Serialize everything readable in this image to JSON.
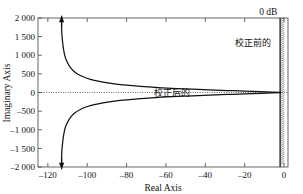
{
  "chart_data": {
    "type": "line",
    "title": "",
    "xlabel": "Real Axis",
    "ylabel": "Imaginary Axis",
    "xlim": [
      -125,
      2
    ],
    "ylim": [
      -2000,
      2000
    ],
    "grid": false,
    "xticks": [
      -120,
      -100,
      -80,
      -60,
      -40,
      -20,
      0
    ],
    "xticklabels": [
      "-120",
      "-100",
      "-80",
      "-60",
      "-40",
      "-20",
      "0"
    ],
    "yticks": [
      -2000,
      -1500,
      -1000,
      -500,
      0,
      500,
      1000,
      1500,
      2000
    ],
    "yticklabels": [
      "-2 000",
      "-1 500",
      "-1 000",
      "-500",
      "0",
      "500",
      "1 000",
      "1 500",
      "2 000"
    ],
    "series": [
      {
        "name": "corrected-locus-upper",
        "asymptote_x": -113,
        "points": [
          [
            -113,
            2000
          ],
          [
            -113,
            1700
          ],
          [
            -112.6,
            1400
          ],
          [
            -112.0,
            1150
          ],
          [
            -111.2,
            950
          ],
          [
            -110.0,
            800
          ],
          [
            -108.4,
            660
          ],
          [
            -106.2,
            545
          ],
          [
            -103.5,
            455
          ],
          [
            -100.2,
            383
          ],
          [
            -96.4,
            325
          ],
          [
            -92.0,
            278
          ],
          [
            -87.0,
            238
          ],
          [
            -81.5,
            204
          ],
          [
            -75.5,
            175
          ],
          [
            -69.0,
            150
          ],
          [
            -62.0,
            127
          ],
          [
            -54.5,
            107
          ],
          [
            -46.5,
            88
          ],
          [
            -38.0,
            70
          ],
          [
            -29.0,
            53
          ],
          [
            -20.0,
            37
          ],
          [
            -12.0,
            22
          ],
          [
            -6.0,
            11
          ],
          [
            -2.5,
            4
          ],
          [
            -1.5,
            0
          ]
        ]
      },
      {
        "name": "corrected-locus-lower",
        "asymptote_x": -113,
        "points": [
          [
            -113,
            -2000
          ],
          [
            -113,
            -1700
          ],
          [
            -112.6,
            -1400
          ],
          [
            -112.0,
            -1150
          ],
          [
            -111.2,
            -950
          ],
          [
            -110.0,
            -800
          ],
          [
            -108.4,
            -660
          ],
          [
            -106.2,
            -545
          ],
          [
            -103.5,
            -455
          ],
          [
            -100.2,
            -383
          ],
          [
            -96.4,
            -325
          ],
          [
            -92.0,
            -278
          ],
          [
            -87.0,
            -238
          ],
          [
            -81.5,
            -204
          ],
          [
            -75.5,
            -175
          ],
          [
            -69.0,
            -150
          ],
          [
            -62.0,
            -127
          ],
          [
            -54.5,
            -107
          ],
          [
            -46.5,
            -88
          ],
          [
            -38.0,
            -70
          ],
          [
            -29.0,
            -53
          ],
          [
            -20.0,
            -37
          ],
          [
            -12.0,
            -22
          ],
          [
            -6.0,
            -11
          ],
          [
            -2.5,
            -4
          ],
          [
            -1.5,
            0
          ]
        ]
      },
      {
        "name": "uncorrected-locus-vertical",
        "type": "vertical-hatched-line",
        "x": -2.0,
        "y_from": -2000,
        "y_to": 2000
      }
    ],
    "zero_line": {
      "y": 0,
      "style": "dotted"
    },
    "arrows": [
      {
        "name": "upper-direction-arrow",
        "x": -113,
        "y": 1900,
        "direction": "up"
      },
      {
        "name": "lower-direction-arrow",
        "x": -113,
        "y": -1900,
        "direction": "down"
      }
    ],
    "annotations": [
      {
        "name": "corrected-label",
        "text": "校正后的",
        "x": -57,
        "y": 0
      },
      {
        "name": "uncorrected-label",
        "text": "校正前的",
        "x": -16,
        "y": 1250
      },
      {
        "name": "zero-db-label",
        "text": "0  dB",
        "x": -8,
        "y": 2150
      }
    ]
  }
}
